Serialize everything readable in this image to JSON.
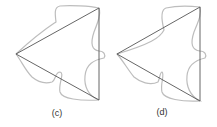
{
  "panels": [
    {
      "id": "c",
      "label": "(c)"
    },
    {
      "id": "d",
      "label": "(d)"
    }
  ],
  "colors": {
    "triangle_edge": "#555555",
    "curve": "#bdbdbd",
    "label": "#333333",
    "background": "#ffffff"
  }
}
